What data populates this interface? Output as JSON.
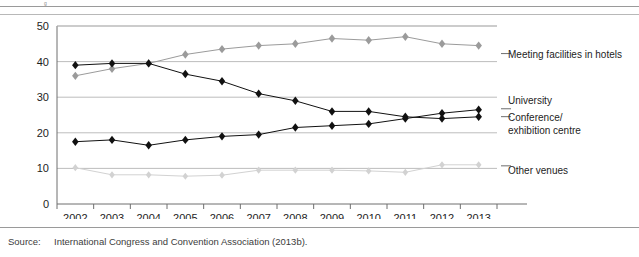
{
  "figure": {
    "caption_stub": "g",
    "source_label": "Source:",
    "source_text": "International Congress and Convention Association (2013b)."
  },
  "legend": {
    "hotels": "Meeting facilities in hotels",
    "university": "University",
    "conference_line1": "Conference/",
    "conference_line2": "exhibition centre",
    "other": "Other venues"
  },
  "colors": {
    "university": "#111111",
    "conference": "#111111",
    "hotels": "#9b9b9b",
    "other": "#d2d2d2",
    "grid": "#b5b5b5",
    "axis": "#6e6e6e",
    "text": "#1d1d1d"
  },
  "chart_data": {
    "type": "line",
    "title": "",
    "subtitle": "",
    "xlabel": "",
    "ylabel": "",
    "ylim": [
      0,
      50
    ],
    "yticks": [
      0,
      10,
      20,
      30,
      40,
      50
    ],
    "grid": true,
    "legend_position": "right",
    "categories": [
      "2002",
      "2003",
      "2004",
      "2005",
      "2006",
      "2007",
      "2008",
      "2009",
      "2010",
      "2011",
      "2012",
      "2013"
    ],
    "series": [
      {
        "name": "Meeting facilities in hotels",
        "color": "#9b9b9b",
        "marker": "diamond",
        "values": [
          36,
          38,
          39.5,
          42,
          43.5,
          44.5,
          45,
          46.5,
          46,
          47,
          45,
          44.5
        ]
      },
      {
        "name": "University",
        "color": "#111111",
        "marker": "diamond",
        "values": [
          39,
          39.5,
          39.5,
          36.5,
          34.5,
          31,
          29,
          26,
          26,
          24.5,
          24,
          24.5
        ]
      },
      {
        "name": "Conference/exhibition centre",
        "color": "#111111",
        "marker": "diamond",
        "values": [
          17.5,
          18,
          16.5,
          18,
          19,
          19.5,
          21.5,
          22,
          22.5,
          24,
          25.5,
          26.5
        ]
      },
      {
        "name": "Other venues",
        "color": "#d2d2d2",
        "marker": "diamond",
        "values": [
          10.2,
          8.2,
          8.2,
          7.8,
          8.1,
          9.5,
          9.5,
          9.5,
          9.3,
          8.9,
          11,
          11
        ]
      }
    ]
  }
}
